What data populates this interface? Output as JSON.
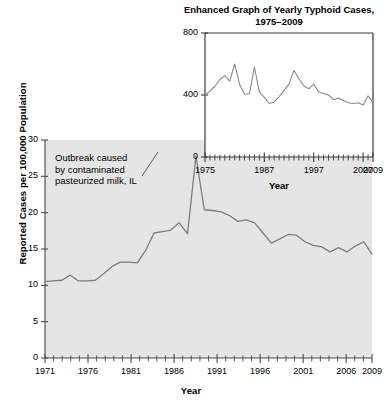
{
  "chart_data": [
    {
      "id": "main",
      "type": "line",
      "title": "",
      "xlabel": "Year",
      "ylabel": "Reported Cases per 100,000 Population",
      "xlim": [
        1971,
        2009
      ],
      "ylim": [
        0,
        30
      ],
      "yticks": [
        0,
        5,
        10,
        15,
        20,
        25,
        30
      ],
      "xticks": [
        1971,
        1976,
        1981,
        1986,
        1991,
        1996,
        2001,
        2006,
        2009
      ],
      "xtick_labels": [
        "1971",
        "1976",
        "1981",
        "1986",
        "1991",
        "1996",
        "2001",
        "2006",
        "2009"
      ],
      "ytick_labels": [
        "0",
        "5",
        "10",
        "15",
        "20",
        "25",
        "30"
      ],
      "grid": false,
      "legend": "none",
      "plot_background": "#e5e5e5",
      "line_color": "#7d7d7d",
      "annotation": "Outbreak caused\nby contaminated\npasteurized milk, IL",
      "annotation_lines": [
        "Outbreak caused",
        "by contaminated",
        "pasteurized milk, IL"
      ],
      "x": [
        1971,
        1972,
        1973,
        1974,
        1975,
        1976,
        1977,
        1978,
        1979,
        1980,
        1981,
        1982,
        1983,
        1984,
        1985,
        1986,
        1987,
        1988,
        1989,
        1990,
        1991,
        1992,
        1993,
        1994,
        1995,
        1996,
        1997,
        1998,
        1999,
        2000,
        2001,
        2002,
        2003,
        2004,
        2005,
        2006,
        2007,
        2008,
        2009
      ],
      "values": [
        10.5,
        10.6,
        10.7,
        11.4,
        10.6,
        10.6,
        10.7,
        11.6,
        12.6,
        13.2,
        13.2,
        13.1,
        14.8,
        17.2,
        17.4,
        17.6,
        18.6,
        17.1,
        27.8,
        20.4,
        20.3,
        20.1,
        19.6,
        18.8,
        19.0,
        18.6,
        17.2,
        15.8,
        16.4,
        17.0,
        16.9,
        16.0,
        15.5,
        15.3,
        14.6,
        15.2,
        14.6,
        15.4,
        16.0,
        14.3
      ]
    },
    {
      "id": "inset",
      "type": "line",
      "title": "Enhanced Graph of Yearly Typhoid Cases, 1975–2009",
      "title_lines": [
        "Enhanced Graph of Yearly Typhoid Cases,",
        "1975–2009"
      ],
      "xlabel": "Year",
      "ylabel": "",
      "xlim": [
        1975,
        2009
      ],
      "ylim": [
        0,
        800
      ],
      "yticks": [
        0,
        400,
        800
      ],
      "ytick_labels": [
        "0",
        "400",
        "800"
      ],
      "xticks": [
        1975,
        1987,
        1997,
        2007,
        2009
      ],
      "xtick_labels": [
        "1975",
        "1987",
        "1997",
        "2007",
        "2009"
      ],
      "grid": false,
      "legend": "none",
      "plot_background": "#ffffff",
      "line_color": "#8a8a8a",
      "x": [
        1975,
        1976,
        1977,
        1978,
        1979,
        1980,
        1981,
        1982,
        1983,
        1984,
        1985,
        1986,
        1987,
        1988,
        1989,
        1990,
        1991,
        1992,
        1993,
        1994,
        1995,
        1996,
        1997,
        1998,
        1999,
        2000,
        2001,
        2002,
        2003,
        2004,
        2005,
        2006,
        2007,
        2008,
        2009
      ],
      "values": [
        400,
        425,
        455,
        500,
        525,
        490,
        600,
        470,
        405,
        410,
        580,
        420,
        385,
        345,
        355,
        390,
        430,
        470,
        560,
        505,
        460,
        440,
        470,
        420,
        410,
        400,
        370,
        380,
        365,
        350,
        345,
        350,
        335,
        395,
        350
      ]
    }
  ],
  "main": {
    "ylabel": "Reported Cases per 100,000 Population",
    "xlabel": "Year",
    "annotation_line_1": "Outbreak caused",
    "annotation_line_2": "by contaminated",
    "annotation_line_3": "pasteurized milk, IL",
    "ytick_0": "0",
    "ytick_1": "5",
    "ytick_2": "10",
    "ytick_3": "15",
    "ytick_4": "20",
    "ytick_5": "25",
    "ytick_6": "30",
    "xtick_0": "1971",
    "xtick_1": "1976",
    "xtick_2": "1981",
    "xtick_3": "1986",
    "xtick_4": "1991",
    "xtick_5": "1996",
    "xtick_6": "2001",
    "xtick_7": "2006",
    "xtick_8": "2009"
  },
  "inset": {
    "title_line_1": "Enhanced Graph of Yearly Typhoid Cases,",
    "title_line_2": "1975–2009",
    "xlabel": "Year",
    "ytick_0": "0",
    "ytick_400": "400",
    "ytick_800": "800",
    "xtick_0": "1975",
    "xtick_1": "1987",
    "xtick_2": "1997",
    "xtick_3": "2007",
    "xtick_4": "2009"
  }
}
